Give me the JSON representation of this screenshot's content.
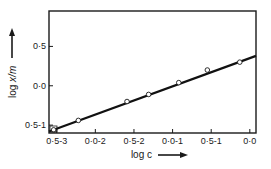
{
  "chart_data": {
    "type": "scatter",
    "title": "",
    "xlabel": "log c",
    "ylabel": "log x/m",
    "xlim": [
      -2.6,
      0.08
    ],
    "ylim": [
      -0.6,
      0.95
    ],
    "grid": false,
    "legend": null,
    "x_ticks": [
      {
        "value": -2.5,
        "label": "0·5-3"
      },
      {
        "value": -2.0,
        "label": "0·0-2"
      },
      {
        "value": -1.5,
        "label": "0·5-2"
      },
      {
        "value": -1.0,
        "label": "0·0-1"
      },
      {
        "value": -0.5,
        "label": "0·5-1"
      },
      {
        "value": 0.0,
        "label": "0·0"
      }
    ],
    "y_ticks": [
      {
        "value": 0.5,
        "label": "0·5"
      },
      {
        "value": 0.0,
        "label": "0·0"
      },
      {
        "value": -0.5,
        "label": "0·5-1"
      }
    ],
    "series": [
      {
        "name": "data",
        "marker": "open-circle",
        "x": [
          -2.54,
          -2.22,
          -1.59,
          -1.31,
          -0.92,
          -0.55,
          -0.13
        ],
        "y": [
          -0.56,
          -0.44,
          -0.2,
          -0.11,
          0.04,
          0.2,
          0.3
        ]
      },
      {
        "name": "fit",
        "style": "line",
        "x": [
          -2.6,
          0.08
        ],
        "y": [
          -0.58,
          0.38
        ]
      }
    ]
  },
  "axes": {
    "x_label": "log c",
    "y_label_prefix": "log ",
    "y_label_var": "x/m"
  }
}
